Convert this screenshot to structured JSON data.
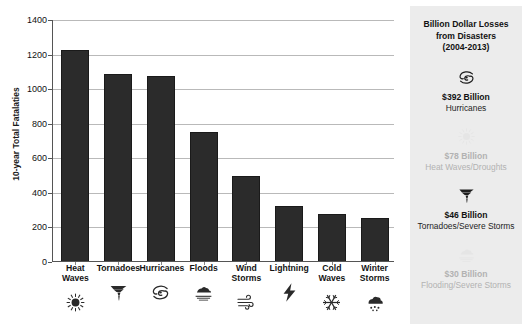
{
  "chart_data": {
    "type": "bar",
    "title": "",
    "xlabel": "",
    "ylabel": "10-year Total Fatalaties",
    "categories": [
      "Heat\nWaves",
      "Tornadoes",
      "Hurricanes",
      "Floods",
      "Wind\nStorms",
      "Lightning",
      "Cold\nWaves",
      "Winter\nStorms"
    ],
    "category_icons": [
      "sun-icon",
      "tornado-icon",
      "hurricane-icon",
      "flood-icon",
      "wind-icon",
      "lightning-icon",
      "snowflake-icon",
      "snow-cloud-icon"
    ],
    "values": [
      1225,
      1090,
      1075,
      750,
      500,
      325,
      275,
      255
    ],
    "ylim": [
      0,
      1400
    ],
    "yticks": [
      0,
      200,
      400,
      600,
      800,
      1000,
      1200,
      1400
    ],
    "ytick_labels": [
      "0",
      "200",
      "400",
      "600",
      "800",
      "1000",
      "1200",
      "1400"
    ],
    "grid": true,
    "legend": "none",
    "bar_color": "#2b2b2b"
  },
  "side_panel": {
    "title": "Billion Dollar Losses\nfrom Disasters\n(2004-2013)",
    "background_color": "#ececec",
    "entries": [
      {
        "icon": "hurricane-icon",
        "amount": "$392 Billion",
        "category": "Hurricanes",
        "faded": false
      },
      {
        "icon": "sun-icon",
        "amount": "$78 Billion",
        "category": "Heat Waves/Droughts",
        "faded": true
      },
      {
        "icon": "tornado-icon",
        "amount": "$46 Billion",
        "category": "Tornadoes/Severe Storms",
        "faded": false
      },
      {
        "icon": "flood-icon",
        "amount": "$30 Billion",
        "category": "Flooding/Severe Storms",
        "faded": true
      }
    ]
  }
}
